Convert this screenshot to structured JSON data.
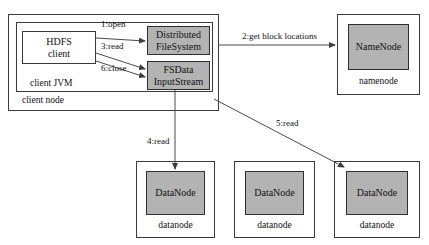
{
  "diagram": {
    "colors": {
      "component_fill": "#b3b3b3",
      "container_fill": "#ffffff",
      "stroke": "#3a3a3a",
      "text": "#111111"
    },
    "client_node": {
      "label": "client node",
      "jvm": {
        "label": "client JVM",
        "client_box": {
          "line1": "HDFS",
          "line2": "client"
        },
        "components": [
          {
            "line1": "Distributed",
            "line2": "FileSystem"
          },
          {
            "line1": "FSData",
            "line2": "InputStream"
          }
        ]
      }
    },
    "namenode": {
      "component": "NameNode",
      "caption": "namenode"
    },
    "datanodes": [
      {
        "component": "DataNode",
        "caption": "datanode"
      },
      {
        "component": "DataNode",
        "caption": "datanode"
      },
      {
        "component": "DataNode",
        "caption": "datanode"
      }
    ],
    "steps": [
      {
        "id": "1",
        "label": "1:open"
      },
      {
        "id": "2",
        "label": "2:get block locations"
      },
      {
        "id": "3",
        "label": "3:read"
      },
      {
        "id": "4",
        "label": "4:read"
      },
      {
        "id": "5",
        "label": "5:read"
      },
      {
        "id": "6",
        "label": "6:close"
      }
    ]
  }
}
